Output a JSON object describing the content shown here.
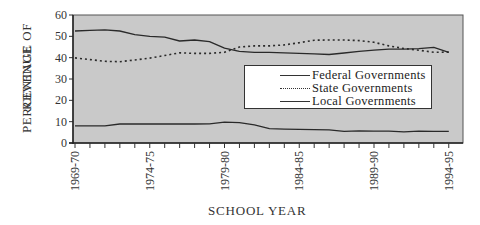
{
  "chart_data": {
    "type": "line",
    "title": "",
    "xlabel": "SCHOOL YEAR",
    "ylabel": "PERCENTAGE OF REVENUE",
    "ylabel_lines": [
      "PERCENTAGE OF",
      "REVENUE"
    ],
    "ylim": [
      0,
      60
    ],
    "yticks": [
      0,
      10,
      20,
      30,
      40,
      50,
      60
    ],
    "x": [
      "1969-70",
      "1970-71",
      "1971-72",
      "1972-73",
      "1973-74",
      "1974-75",
      "1975-76",
      "1976-77",
      "1977-78",
      "1978-79",
      "1979-80",
      "1980-81",
      "1981-82",
      "1982-83",
      "1983-84",
      "1984-85",
      "1985-86",
      "1986-87",
      "1987-88",
      "1988-89",
      "1989-90",
      "1990-91",
      "1991-92",
      "1992-93",
      "1993-94",
      "1994-95"
    ],
    "xtick_labels": [
      "1969-70",
      "1974-75",
      "1979-80",
      "1984-85",
      "1989-90",
      "1994-95"
    ],
    "series": [
      {
        "name": "Federal Governments",
        "style": "solid",
        "values": [
          8.0,
          8.0,
          8.0,
          8.9,
          8.9,
          8.9,
          8.9,
          8.9,
          8.9,
          9.0,
          9.8,
          9.5,
          8.5,
          6.7,
          6.5,
          6.4,
          6.3,
          6.2,
          5.5,
          5.7,
          5.6,
          5.6,
          5.2,
          5.6,
          5.5,
          5.5
        ]
      },
      {
        "name": "State Governments",
        "style": "dotted",
        "values": [
          39.9,
          39.1,
          38.3,
          38.1,
          38.9,
          39.8,
          41.0,
          42.3,
          42.0,
          42.0,
          42.5,
          45.0,
          45.5,
          45.5,
          46.0,
          47.0,
          48.2,
          48.3,
          48.3,
          48.0,
          47.2,
          45.5,
          44.3,
          43.5,
          42.5,
          42.6
        ]
      },
      {
        "name": "Local Governments",
        "style": "solid",
        "values": [
          52.5,
          52.8,
          53.0,
          52.5,
          50.8,
          50.0,
          49.6,
          47.8,
          48.3,
          47.5,
          44.5,
          43.0,
          42.5,
          42.5,
          42.3,
          42.0,
          41.8,
          41.5,
          42.2,
          43.0,
          43.5,
          44.0,
          44.0,
          44.2,
          44.8,
          42.5
        ]
      }
    ],
    "legend_position": "center-right inside plot",
    "grid": false,
    "background": "#c9c9c9"
  },
  "legend": {
    "items": [
      {
        "label": "Federal Governments"
      },
      {
        "label": "State Governments"
      },
      {
        "label": "Local Governments"
      }
    ]
  }
}
